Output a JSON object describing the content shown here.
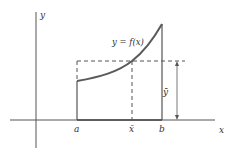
{
  "diagram": {
    "colors": {
      "curve": "#5a5a5a",
      "axis": "#555555",
      "dashed": "#555555",
      "text": "#333333",
      "background": "#ffffff"
    },
    "labels": {
      "y_axis": "y",
      "x_axis": "x",
      "curve": "y = f(x)",
      "a": "a",
      "b": "b",
      "x_bar": "x̄",
      "y_bar": "ȳ"
    }
  }
}
